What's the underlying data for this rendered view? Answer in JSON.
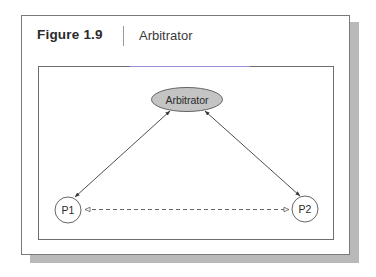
{
  "figure": {
    "number_label": "Figure 1.9",
    "title": "Arbitrator"
  },
  "diagram": {
    "nodes": [
      {
        "id": "arbitrator",
        "label": "Arbitrator",
        "shape": "ellipse",
        "fill": "#c4c4c4"
      },
      {
        "id": "p1",
        "label": "P1",
        "shape": "circle",
        "fill": "#ffffff"
      },
      {
        "id": "p2",
        "label": "P2",
        "shape": "circle",
        "fill": "#ffffff"
      }
    ],
    "edges": [
      {
        "from": "arbitrator",
        "to": "p1",
        "style": "solid",
        "direction": "bidirectional"
      },
      {
        "from": "arbitrator",
        "to": "p2",
        "style": "solid",
        "direction": "bidirectional"
      },
      {
        "from": "p1",
        "to": "p2",
        "style": "dashed",
        "direction": "bidirectional",
        "arrowhead": "open-triangle"
      }
    ]
  },
  "colors": {
    "border": "#6e6e6e",
    "shadow": "#b9b9b9",
    "arbitrator_fill": "#c4c4c4"
  }
}
